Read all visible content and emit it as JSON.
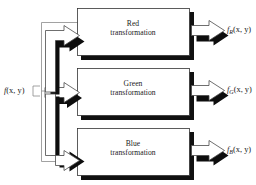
{
  "diagram": {
    "input": {
      "label_f": "f",
      "label_args": "(x, y)",
      "full": "f(x, y)"
    },
    "channels": [
      {
        "id": "red",
        "box_line1": "Red",
        "box_line2": "transformation",
        "output_f": "f",
        "output_sub": "R",
        "output_args": "(x, y)",
        "output_full": "fR(x, y)"
      },
      {
        "id": "green",
        "box_line1": "Green",
        "box_line2": "transformation",
        "output_f": "f",
        "output_sub": "G",
        "output_args": "(x, y)",
        "output_full": "fG(x, y)"
      },
      {
        "id": "blue",
        "box_line1": "Blue",
        "box_line2": "transformation",
        "output_f": "f",
        "output_sub": "B",
        "output_args": "(x, y)",
        "output_full": "fB(x, y)"
      }
    ],
    "colors": {
      "background": "#ffffff",
      "box_fill": "#ffffff",
      "box_border": "#333333",
      "shadow": "#111111",
      "arrow_fill": "#ffffff",
      "arrow_border": "#4a4a4a",
      "text": "#1a1a1a",
      "trunk_line": "#8a8a8a"
    }
  }
}
